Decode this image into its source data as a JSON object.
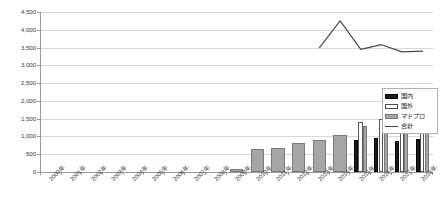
{
  "chart_data": {
    "type": "bar",
    "title": "",
    "xlabel": "",
    "ylabel": "",
    "ylim": [
      0,
      4500
    ],
    "ytick_step": 500,
    "grid": true,
    "legend_position": "right",
    "ytick_labels": [
      "4,500",
      "4,000",
      "3,500",
      "3,000",
      "2,500",
      "2,000",
      "1,500",
      "1,000",
      "500",
      "0"
    ],
    "categories": [
      "2000年",
      "2001年",
      "2002年",
      "2003年",
      "2004年",
      "2005年",
      "2006年",
      "2007年",
      "2008年",
      "2009年",
      "2010年",
      "2011年",
      "2012年",
      "2013年",
      "2014年",
      "2015年",
      "2016年",
      "2017年",
      "2018年"
    ],
    "series": [
      {
        "name": "国内",
        "color": "#1a1a1a",
        "values": [
          null,
          null,
          null,
          null,
          null,
          null,
          null,
          null,
          null,
          null,
          null,
          null,
          null,
          null,
          null,
          900,
          960,
          880,
          930
        ]
      },
      {
        "name": "国外",
        "color": "#ffffff",
        "values": [
          null,
          null,
          null,
          null,
          null,
          null,
          null,
          null,
          null,
          null,
          null,
          null,
          null,
          null,
          null,
          1420,
          1490,
          1320,
          1420
        ]
      },
      {
        "name": "マドプロ",
        "color": "#a6a6a6",
        "values": [
          null,
          null,
          null,
          null,
          null,
          null,
          null,
          0,
          0,
          80,
          640,
          680,
          820,
          900,
          1030,
          1300,
          1400,
          1240,
          1310
        ]
      },
      {
        "name": "合計",
        "color": "#4a4a4a",
        "type": "line",
        "values": [
          null,
          null,
          null,
          null,
          null,
          null,
          null,
          null,
          null,
          null,
          null,
          null,
          null,
          3500,
          4250,
          3450,
          3580,
          3380,
          3400
        ]
      }
    ],
    "legend_entries": [
      {
        "label": "国内",
        "swatch": "filled-black"
      },
      {
        "label": "国外",
        "swatch": "outline-white"
      },
      {
        "label": "マドプロ",
        "swatch": "filled-gray"
      },
      {
        "label": "合計",
        "swatch": "line"
      }
    ]
  }
}
